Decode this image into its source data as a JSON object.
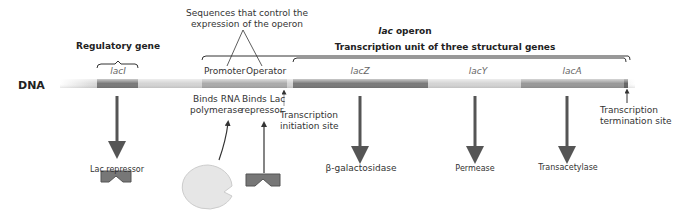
{
  "dna_label": "DNA",
  "regulatory": {
    "title": "Regulatory gene",
    "gene": "lacI"
  },
  "control": {
    "title_line1": "Sequences that control the",
    "title_line2": "expression of the operon",
    "promoter": "Promoter",
    "operator": "Operator"
  },
  "operon": {
    "title_italic": "lac",
    "title_rest": " operon",
    "unit": "Transcription unit of three structural genes"
  },
  "genes": [
    {
      "name": "lacZ"
    },
    {
      "name": "lacY"
    },
    {
      "name": "lacA"
    }
  ],
  "annotations": {
    "binds_rna_1": "Binds RNA",
    "binds_rna_2": "polymerase",
    "binds_lac_1": "Binds Lac",
    "binds_lac_2": "repressor",
    "init_1": "Transcription",
    "init_2": "initiation site",
    "term_1": "Transcription",
    "term_2": "termination site"
  },
  "products": {
    "repressor": "Lac repressor",
    "lacZ": "β-galactosidase",
    "lacY": "Permease",
    "lacA": "Transacetylase"
  },
  "colors": {
    "dna_light": "#d4d4d4",
    "gene_dark": "#7a7a7a",
    "control": "#a9a9a9",
    "arrow": "#555555"
  }
}
